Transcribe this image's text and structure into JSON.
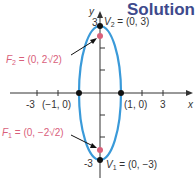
{
  "title": "Solution",
  "axes": {
    "x_label": "x",
    "y_label": "y",
    "x_ticks": [
      "-3",
      "3"
    ],
    "y_ticks": [
      "3",
      "-3"
    ]
  },
  "points": {
    "v2": {
      "label": "V",
      "sub": "2",
      "coords": " = (0, 3)"
    },
    "v1": {
      "label": "V",
      "sub": "1",
      "coords": " = (0, −3)"
    },
    "f2": {
      "label": "F",
      "sub": "2",
      "coords": " = (0, 2√2)"
    },
    "f1": {
      "label": "F",
      "sub": "1",
      "coords": " = (0, −2√2)"
    },
    "left": {
      "coords": "(−1, 0)"
    },
    "right": {
      "coords": "(1, 0)"
    }
  },
  "colors": {
    "ellipse": "#3a9ad9",
    "focus": "#d9607a",
    "title": "#3e4a8c"
  }
}
